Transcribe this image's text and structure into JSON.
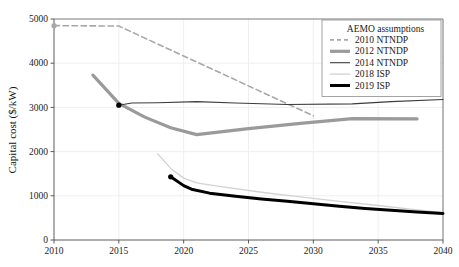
{
  "chart_data": {
    "type": "line",
    "title": "",
    "xlabel": "",
    "ylabel": "Capital cost ($/kW)",
    "xlim": [
      2010,
      2040
    ],
    "ylim": [
      0,
      5000
    ],
    "grid": true,
    "x_ticks": [
      "2010",
      "2015",
      "2020",
      "2025",
      "2030",
      "2035",
      "2040"
    ],
    "y_ticks": [
      "0",
      "1000",
      "2000",
      "3000",
      "4000",
      "5000"
    ],
    "legend_position": "top-right",
    "legend_title": "AEMO assumptions",
    "series": [
      {
        "name": "2010 NTNDP",
        "style": "dashed",
        "color": "#a8a8a8",
        "width": 1.6,
        "marker_start": true,
        "marker_color": "#a8a8a8",
        "points": [
          [
            2010,
            4850
          ],
          [
            2015,
            4840
          ],
          [
            2030,
            2810
          ]
        ]
      },
      {
        "name": "2012 NTNDP",
        "style": "solid",
        "color": "#9a9a9a",
        "width": 3.2,
        "marker_start": false,
        "marker_color": "#9a9a9a",
        "points": [
          [
            2013,
            3730
          ],
          [
            2015,
            3090
          ],
          [
            2017,
            2780
          ],
          [
            2019,
            2540
          ],
          [
            2021,
            2385
          ],
          [
            2025,
            2520
          ],
          [
            2029,
            2640
          ],
          [
            2033,
            2745
          ],
          [
            2038,
            2740
          ]
        ]
      },
      {
        "name": "2014 NTNDP",
        "style": "solid",
        "color": "#3c3c3c",
        "width": 1.1,
        "marker_start": true,
        "marker_color": "#000000",
        "points": [
          [
            2015,
            3050
          ],
          [
            2016,
            3100
          ],
          [
            2018,
            3105
          ],
          [
            2021,
            3130
          ],
          [
            2024,
            3100
          ],
          [
            2028,
            3065
          ],
          [
            2033,
            3080
          ],
          [
            2036,
            3130
          ],
          [
            2040,
            3180
          ]
        ]
      },
      {
        "name": "2018 ISP",
        "style": "solid",
        "color": "#d2d2d2",
        "width": 1.3,
        "marker_start": false,
        "marker_color": "#d2d2d2",
        "points": [
          [
            2018,
            1950
          ],
          [
            2019,
            1620
          ],
          [
            2020,
            1400
          ],
          [
            2021,
            1290
          ],
          [
            2023,
            1200
          ],
          [
            2026,
            1080
          ],
          [
            2029,
            975
          ],
          [
            2032,
            875
          ],
          [
            2035,
            780
          ],
          [
            2038,
            680
          ],
          [
            2040,
            620
          ]
        ]
      },
      {
        "name": "2019 ISP",
        "style": "solid",
        "color": "#000000",
        "width": 3.0,
        "marker_start": true,
        "marker_color": "#000000",
        "points": [
          [
            2019,
            1430
          ],
          [
            2020,
            1230
          ],
          [
            2020.6,
            1150
          ],
          [
            2022,
            1060
          ],
          [
            2024,
            990
          ],
          [
            2026,
            930
          ],
          [
            2028,
            875
          ],
          [
            2030,
            820
          ],
          [
            2032,
            765
          ],
          [
            2034,
            715
          ],
          [
            2036,
            675
          ],
          [
            2038,
            635
          ],
          [
            2040,
            600
          ]
        ]
      }
    ]
  },
  "axes": {
    "plot_left": 54,
    "plot_right": 443,
    "plot_top": 19,
    "plot_bottom": 240
  }
}
